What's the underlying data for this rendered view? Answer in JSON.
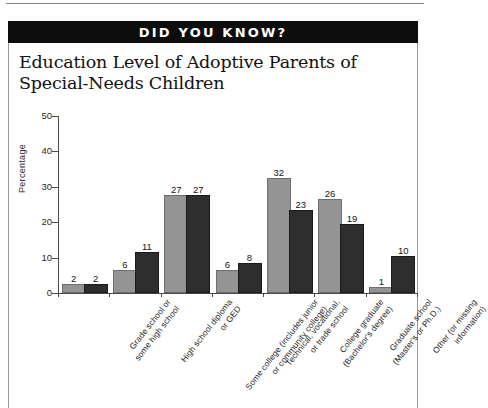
{
  "banner": {
    "label": "DID YOU KNOW?"
  },
  "card": {
    "title_line1": "Education Level of Adoptive Parents of",
    "title_line2": "Special-Needs Children"
  },
  "colors": {
    "series1": "#949494",
    "series2": "#2e2e2e",
    "banner_bg": "#0d0d0d",
    "banner_text": "#ffffff",
    "axis": "#4a4a4a"
  },
  "chart_data": {
    "type": "bar",
    "title": "Education Level of Adoptive Parents of Special-Needs Children",
    "xlabel": "",
    "ylabel": "Percentage",
    "ylim": [
      0,
      50
    ],
    "yticks": [
      0,
      10,
      20,
      30,
      40,
      50
    ],
    "grid": false,
    "legend": "none",
    "categories": [
      [
        "Grade school or",
        "some high school"
      ],
      [
        "High school diploma",
        "or GED"
      ],
      [
        "Some college (includes junior",
        "or community college)"
      ],
      [
        "Technical, vocational,",
        "or trade school"
      ],
      [
        "College graduate",
        "(Bachelor's degree)"
      ],
      [
        "Graduate school",
        "(Master's or Ph.D.)"
      ],
      [
        "Other (or missing",
        "information)"
      ]
    ],
    "series": [
      {
        "name": "series-1",
        "values": [
          2,
          6,
          27,
          6,
          32,
          26,
          1
        ]
      },
      {
        "name": "series-2",
        "values": [
          2,
          11,
          27,
          8,
          23,
          19,
          10
        ]
      }
    ]
  }
}
